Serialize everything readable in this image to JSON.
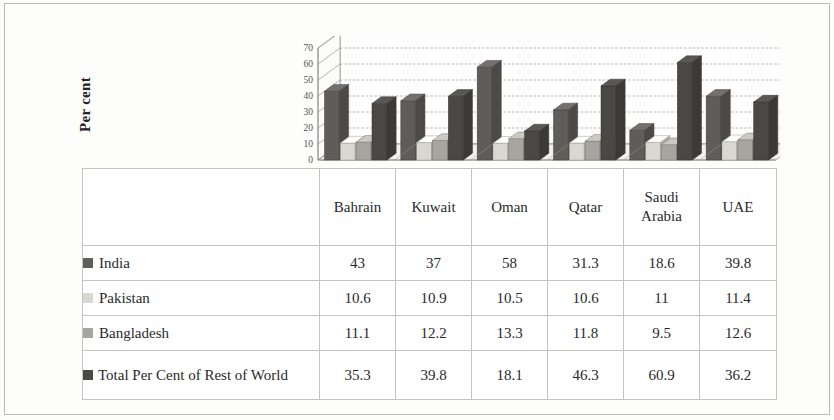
{
  "axis": {
    "y_title": "Per cent",
    "ticks": [
      "70",
      "60",
      "50",
      "40",
      "30",
      "20",
      "10",
      "0"
    ]
  },
  "colors": {
    "india": "#5f5c59",
    "pakistan": "#d9d7d0",
    "bangladesh": "#a7a5a0",
    "total": "#4a4845",
    "gridline": "#9b9893",
    "axisline": "#8d8a85",
    "floor": "#f2f1ee",
    "border": "#c6c4c0",
    "text": "#29292b"
  },
  "table": {
    "countries": [
      "Bahrain",
      "Kuwait",
      "Oman",
      "Qatar",
      "Saudi Arabia",
      "UAE"
    ],
    "rows": [
      {
        "label": "India",
        "legend": "india-swatch",
        "values": [
          "43",
          "37",
          "58",
          "31.3",
          "18.6",
          "39.8"
        ]
      },
      {
        "label": "Pakistan",
        "legend": "pakistan-swatch",
        "values": [
          "10.6",
          "10.9",
          "10.5",
          "10.6",
          "11",
          "11.4"
        ]
      },
      {
        "label": "Bangladesh",
        "legend": "bangladesh-swatch",
        "values": [
          "11.1",
          "12.2",
          "13.3",
          "11.8",
          "9.5",
          "12.6"
        ]
      },
      {
        "label": "Total Per Cent of Rest of World",
        "legend": "total-swatch",
        "values": [
          "35.3",
          "39.8",
          "18.1",
          "46.3",
          "60.9",
          "36.2"
        ]
      }
    ]
  },
  "chart_data": {
    "type": "bar",
    "title": "",
    "xlabel": "",
    "ylabel": "Per cent",
    "ylim": [
      0,
      70
    ],
    "yticks": [
      0,
      10,
      20,
      30,
      40,
      50,
      60,
      70
    ],
    "grid": true,
    "legend_position": "table-below",
    "three_d": true,
    "categories": [
      "Bahrain",
      "Kuwait",
      "Oman",
      "Qatar",
      "Saudi Arabia",
      "UAE"
    ],
    "series": [
      {
        "name": "India",
        "color": "#5f5c59",
        "values": [
          43,
          37,
          58,
          31.3,
          18.6,
          39.8
        ]
      },
      {
        "name": "Pakistan",
        "color": "#d9d7d0",
        "values": [
          10.6,
          10.9,
          10.5,
          10.6,
          11,
          11.4
        ]
      },
      {
        "name": "Bangladesh",
        "color": "#a7a5a0",
        "values": [
          11.1,
          12.2,
          13.3,
          11.8,
          9.5,
          12.6
        ]
      },
      {
        "name": "Total Per Cent of Rest of World",
        "color": "#4a4845",
        "values": [
          35.3,
          39.8,
          18.1,
          46.3,
          60.9,
          36.2
        ]
      }
    ]
  }
}
